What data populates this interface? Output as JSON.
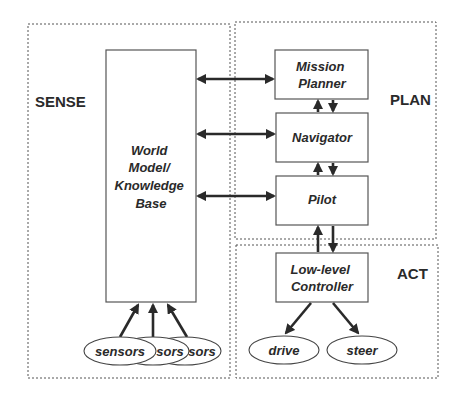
{
  "regions": {
    "sense": {
      "label": "SENSE"
    },
    "plan": {
      "label": "PLAN"
    },
    "act": {
      "label": "ACT"
    }
  },
  "nodes": {
    "world_model": {
      "lines": [
        "World",
        "Model/",
        "Knowledge",
        "Base"
      ]
    },
    "mission_planner": {
      "lines": [
        "Mission",
        "Planner"
      ]
    },
    "navigator": {
      "lines": [
        "Navigator"
      ]
    },
    "pilot": {
      "lines": [
        "Pilot"
      ]
    },
    "low_level_controller": {
      "lines": [
        "Low-level",
        "Controller"
      ]
    }
  },
  "sensors": {
    "labels": [
      "sensors",
      "sors",
      "sors"
    ]
  },
  "actuators": {
    "drive": "drive",
    "steer": "steer"
  },
  "connections": [
    {
      "from": "world_model",
      "to": "mission_planner",
      "type": "bidirectional"
    },
    {
      "from": "world_model",
      "to": "navigator",
      "type": "bidirectional"
    },
    {
      "from": "world_model",
      "to": "pilot",
      "type": "bidirectional"
    },
    {
      "from": "mission_planner",
      "to": "navigator",
      "type": "up-down pair"
    },
    {
      "from": "navigator",
      "to": "pilot",
      "type": "up-down pair"
    },
    {
      "from": "pilot",
      "to": "low_level_controller",
      "type": "up-down pair"
    },
    {
      "from": "low_level_controller",
      "to": "drive",
      "type": "directed"
    },
    {
      "from": "low_level_controller",
      "to": "steer",
      "type": "directed"
    },
    {
      "from": "sensors",
      "to": "world_model",
      "type": "directed"
    }
  ]
}
